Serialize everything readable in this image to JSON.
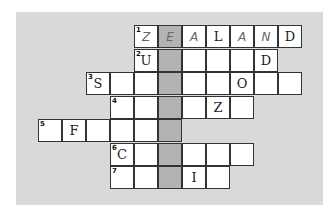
{
  "crossword": {
    "grid_origin": {
      "x": 38,
      "y": 25
    },
    "cell_width": 24,
    "cell_height": 23.5,
    "shaded_column": 5,
    "rows": [
      {
        "row": 0,
        "number": "1",
        "start_col": 4,
        "cells": [
          {
            "letter": "Z",
            "style": "hand"
          },
          {
            "letter": "E",
            "style": "hand"
          },
          {
            "letter": "A",
            "style": "hand"
          },
          {
            "letter": "L",
            "style": "print"
          },
          {
            "letter": "A",
            "style": "hand"
          },
          {
            "letter": "N",
            "style": "hand"
          },
          {
            "letter": "D",
            "style": "print"
          }
        ]
      },
      {
        "row": 1,
        "number": "2",
        "start_col": 4,
        "cells": [
          {
            "letter": "U",
            "style": "print"
          },
          {
            "letter": ""
          },
          {
            "letter": ""
          },
          {
            "letter": ""
          },
          {
            "letter": ""
          },
          {
            "letter": "D",
            "style": "print"
          }
        ]
      },
      {
        "row": 2,
        "number": "3",
        "start_col": 2,
        "cells": [
          {
            "letter": "S",
            "style": "print"
          },
          {
            "letter": ""
          },
          {
            "letter": ""
          },
          {
            "letter": ""
          },
          {
            "letter": ""
          },
          {
            "letter": ""
          },
          {
            "letter": "O",
            "style": "print"
          },
          {
            "letter": ""
          },
          {
            "letter": ""
          }
        ]
      },
      {
        "row": 3,
        "number": "4",
        "start_col": 3,
        "cells": [
          {
            "letter": ""
          },
          {
            "letter": ""
          },
          {
            "letter": ""
          },
          {
            "letter": ""
          },
          {
            "letter": "Z",
            "style": "print"
          },
          {
            "letter": ""
          }
        ]
      },
      {
        "row": 4,
        "number": "5",
        "start_col": 0,
        "cells": [
          {
            "letter": ""
          },
          {
            "letter": "F",
            "style": "print"
          },
          {
            "letter": ""
          },
          {
            "letter": ""
          },
          {
            "letter": ""
          },
          {
            "letter": ""
          }
        ]
      },
      {
        "row": 5,
        "number": "6",
        "start_col": 3,
        "cells": [
          {
            "letter": "C",
            "style": "print"
          },
          {
            "letter": ""
          },
          {
            "letter": ""
          },
          {
            "letter": ""
          },
          {
            "letter": ""
          },
          {
            "letter": ""
          }
        ]
      },
      {
        "row": 6,
        "number": "7",
        "start_col": 3,
        "cells": [
          {
            "letter": ""
          },
          {
            "letter": ""
          },
          {
            "letter": ""
          },
          {
            "letter": "I",
            "style": "print"
          },
          {
            "letter": ""
          }
        ]
      }
    ],
    "colors": {
      "panel": "#d9d9d7",
      "cell": "#ffffff",
      "shaded": "#b3b3b1",
      "border": "#333333"
    }
  }
}
